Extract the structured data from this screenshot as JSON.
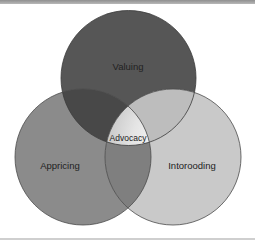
{
  "diagram": {
    "type": "venn",
    "sets": [
      {
        "id": "top",
        "label": "Valuing",
        "color": "#565656"
      },
      {
        "id": "left",
        "label": "Appricing",
        "color": "#8b8b8b"
      },
      {
        "id": "right",
        "label": "Intorooding",
        "color": "#c9c9c9"
      }
    ],
    "overlaps": {
      "top_left": "#484848",
      "top_right": "#bdbdbd",
      "left_right": "#7f7f7f"
    },
    "center": {
      "label": "Advocacy"
    }
  }
}
